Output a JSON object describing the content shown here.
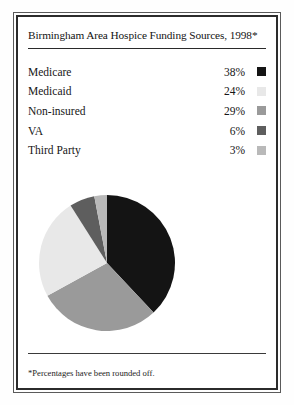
{
  "title": "Birmingham Area Hospice Funding Sources, 1998*",
  "footnote": "*Percentages have been rounded off.",
  "legend": [
    {
      "label": "Medicare",
      "pct": "38%",
      "color": "#141414"
    },
    {
      "label": "Medicaid",
      "pct": "24%",
      "color": "#e8e8e8"
    },
    {
      "label": "Non-insured",
      "pct": "29%",
      "color": "#9a9a9a"
    },
    {
      "label": "VA",
      "pct": "6%",
      "color": "#5e5e5e"
    },
    {
      "label": "Third Party",
      "pct": "3%",
      "color": "#b9b9b9"
    }
  ],
  "chart_data": {
    "type": "pie",
    "title": "Birmingham Area Hospice Funding Sources, 1998*",
    "categories": [
      "Medicare",
      "Medicaid",
      "Non-insured",
      "VA",
      "Third Party"
    ],
    "values": [
      38,
      24,
      29,
      6,
      3
    ],
    "value_labels": [
      "38%",
      "24%",
      "29%",
      "6%",
      "3%"
    ],
    "colors": [
      "#141414",
      "#e8e8e8",
      "#9a9a9a",
      "#5e5e5e",
      "#b9b9b9"
    ],
    "units": "percent",
    "total": 100,
    "start_angle_deg": 0,
    "direction": "clockwise",
    "draw_order": [
      "Medicare",
      "Non-insured",
      "Medicaid",
      "VA",
      "Third Party"
    ],
    "legend_position": "above-chart",
    "grid": false,
    "xlabel": "",
    "ylabel": "",
    "annotations": [
      "*Percentages have been rounded off."
    ]
  }
}
